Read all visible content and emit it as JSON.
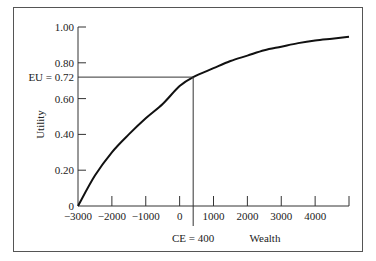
{
  "chart_data": {
    "type": "line",
    "title": "",
    "xlabel": "Wealth",
    "ylabel": "Utility",
    "xlim": [
      -3000,
      5000
    ],
    "ylim": [
      0,
      1.0
    ],
    "x_ticks": [
      -3000,
      -2000,
      -1000,
      0,
      1000,
      2000,
      3000,
      4000,
      5000
    ],
    "x_tick_labels": [
      "−3000",
      "−2000",
      "−1000",
      "0",
      "1000",
      "2000",
      "3000",
      "4000"
    ],
    "y_ticks": [
      0,
      0.2,
      0.4,
      0.6,
      0.8,
      1.0
    ],
    "y_tick_labels": [
      "0",
      "0.20",
      "0.40",
      "0.60",
      "0.80",
      "1.00"
    ],
    "series": [
      {
        "name": "Utility curve",
        "x": [
          -3000,
          -2500,
          -2000,
          -1500,
          -1000,
          -500,
          0,
          400,
          1000,
          1500,
          2000,
          2500,
          3000,
          3500,
          4000,
          4500,
          5000
        ],
        "y": [
          0,
          0.17,
          0.3,
          0.4,
          0.49,
          0.57,
          0.67,
          0.72,
          0.77,
          0.81,
          0.84,
          0.87,
          0.89,
          0.91,
          0.925,
          0.935,
          0.945
        ]
      }
    ],
    "annotations": [
      {
        "text": "EU = 0.72",
        "axis": "y",
        "value": 0.72
      },
      {
        "text": "CE = 400",
        "axis": "x",
        "value": 400
      }
    ],
    "grid": false,
    "legend": "none"
  }
}
